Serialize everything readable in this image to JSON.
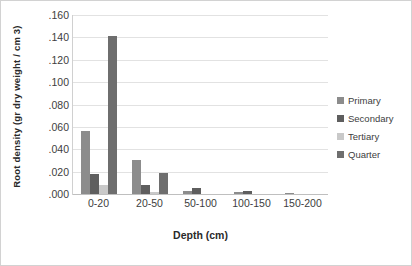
{
  "chart_data": {
    "type": "bar",
    "title": "",
    "xlabel": "Depth (cm)",
    "ylabel": "Root density (gr dry weight / cm 3)",
    "categories": [
      "0-20",
      "20-50",
      "50-100",
      "100-150",
      "150-200"
    ],
    "series": [
      {
        "name": "Primary",
        "color": "#8c8c8c",
        "values": [
          0.056,
          0.03,
          0.003,
          0.002,
          0.001
        ]
      },
      {
        "name": "Secondary",
        "color": "#5e5e5e",
        "values": [
          0.018,
          0.008,
          0.005,
          0.003,
          0.0
        ]
      },
      {
        "name": "Tertiary",
        "color": "#c9c9c9",
        "values": [
          0.008,
          0.002,
          0.0,
          0.0,
          0.0
        ]
      },
      {
        "name": "Quarter",
        "color": "#6e6e6e",
        "values": [
          0.141,
          0.019,
          0.0,
          0.0,
          0.0
        ]
      }
    ],
    "yticks": [
      ".160",
      ".140",
      ".120",
      ".100",
      ".080",
      ".060",
      ".040",
      ".020",
      ".000"
    ],
    "ytick_values": [
      0.16,
      0.14,
      0.12,
      0.1,
      0.08,
      0.06,
      0.04,
      0.02,
      0.0
    ],
    "ylim": [
      0.0,
      0.16
    ],
    "grid": true,
    "legend_position": "right"
  }
}
